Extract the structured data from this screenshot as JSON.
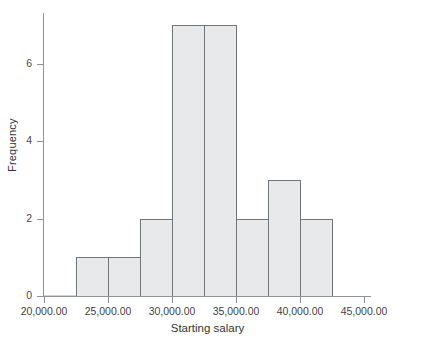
{
  "chart_data": {
    "type": "bar",
    "title": "",
    "subtitle": "",
    "xlabel": "Starting salary",
    "ylabel": "Frequency",
    "grid": false,
    "legend": null,
    "legend_position": "none",
    "xlim": [
      20000,
      45000
    ],
    "ylim": [
      0,
      7
    ],
    "bin_width": 2500,
    "xticks": [
      20000,
      25000,
      30000,
      35000,
      40000,
      45000
    ],
    "xtick_labels": [
      "20,000.00",
      "25,000.00",
      "30,000.00",
      "35,000.00",
      "40,000.00",
      "45,000.00"
    ],
    "yticks": [
      0,
      2,
      4,
      6
    ],
    "ytick_labels": [
      "0",
      "2",
      "4",
      "6"
    ],
    "categories": [
      "22,500.00 - 25,000.00",
      "25,000.00 - 27,500.00",
      "27,500.00 - 30,000.00",
      "30,000.00 - 32,500.00",
      "32,500.00 - 35,000.00",
      "35,000.00 - 37,500.00",
      "37,500.00 - 40,000.00",
      "40,000.00 - 42,500.00"
    ],
    "bin_edges": [
      22500,
      25000,
      27500,
      30000,
      32500,
      35000,
      37500,
      40000,
      42500
    ],
    "values": [
      1,
      1,
      2,
      7,
      7,
      2,
      3,
      2
    ],
    "total_count": 25,
    "bars": [
      {
        "label": "22,500.00 - 25,000.00",
        "x0": 22500,
        "x1": 25000,
        "value": 1
      },
      {
        "label": "25,000.00 - 27,500.00",
        "x0": 25000,
        "x1": 27500,
        "value": 1
      },
      {
        "label": "27,500.00 - 30,000.00",
        "x0": 27500,
        "x1": 30000,
        "value": 2
      },
      {
        "label": "30,000.00 - 32,500.00",
        "x0": 30000,
        "x1": 32500,
        "value": 7
      },
      {
        "label": "32,500.00 - 35,000.00",
        "x0": 32500,
        "x1": 35000,
        "value": 7
      },
      {
        "label": "35,000.00 - 37,500.00",
        "x0": 35000,
        "x1": 37500,
        "value": 2
      },
      {
        "label": "37,500.00 - 40,000.00",
        "x0": 37500,
        "x1": 40000,
        "value": 3
      },
      {
        "label": "40,000.00 - 42,500.00",
        "x0": 40000,
        "x1": 42500,
        "value": 2
      }
    ],
    "colors": {
      "bar_fill": "#e7e9eb",
      "bar_edge": "#6f7578",
      "axis": "#8d9396",
      "text": "#333333",
      "baseline_tint": "#bfdcdc"
    }
  }
}
